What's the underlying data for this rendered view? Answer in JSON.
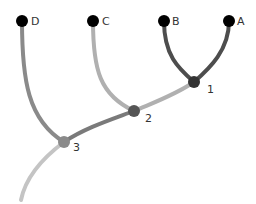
{
  "diagram": {
    "type": "dendrogram",
    "leaves": [
      {
        "id": "D",
        "label": "D",
        "x": 22,
        "y": 21
      },
      {
        "id": "C",
        "label": "C",
        "x": 93,
        "y": 21
      },
      {
        "id": "B",
        "label": "B",
        "x": 164,
        "y": 21
      },
      {
        "id": "A",
        "label": "A",
        "x": 229,
        "y": 21
      }
    ],
    "internal_nodes": [
      {
        "id": "1",
        "label": "1",
        "x": 194,
        "y": 82,
        "color": "#333333",
        "children": [
          "A",
          "B"
        ]
      },
      {
        "id": "2",
        "label": "2",
        "x": 134,
        "y": 111,
        "color": "#555555",
        "children": [
          "1",
          "C"
        ]
      },
      {
        "id": "3",
        "label": "3",
        "x": 64,
        "y": 142,
        "color": "#8a8a8a",
        "children": [
          "2",
          "D"
        ]
      }
    ],
    "edges": [
      {
        "from": "A",
        "to": "1",
        "color": "#4d4d4d"
      },
      {
        "from": "B",
        "to": "1",
        "color": "#4d4d4d"
      },
      {
        "from": "1",
        "to": "2",
        "color": "#b0b0b0"
      },
      {
        "from": "C",
        "to": "2",
        "color": "#b0b0b0"
      },
      {
        "from": "2",
        "to": "3",
        "color": "#7a7a7a"
      },
      {
        "from": "D",
        "to": "3",
        "color": "#8a8a8a"
      },
      {
        "from": "3",
        "to": "root",
        "color": "#c4c4c4"
      }
    ],
    "leaf_color": "#000000"
  }
}
